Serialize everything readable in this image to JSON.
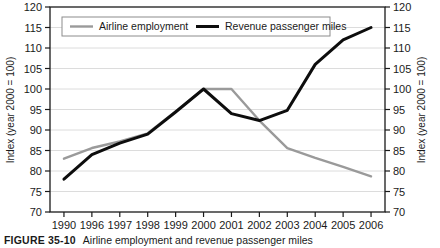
{
  "figure": {
    "caption_number": "FIGURE 35-10",
    "caption_text": "Airline employment and revenue passenger miles"
  },
  "legend": {
    "position": "top-inside",
    "items": [
      {
        "label": "Airline employment",
        "color": "#9a9a9a"
      },
      {
        "label": "Revenue passenger miles",
        "color": "#0d0d0d"
      }
    ]
  },
  "axes": {
    "left_label": "Index (year 2000 = 100)",
    "right_label": "Index (year 2000 = 100)",
    "y_ticks": [
      "70",
      "75",
      "80",
      "85",
      "90",
      "95",
      "100",
      "105",
      "110",
      "115",
      "120"
    ],
    "x_ticks": [
      "1990",
      "1996",
      "1997",
      "1998",
      "1999",
      "2000",
      "2001",
      "2002",
      "2003",
      "2004",
      "2005",
      "2006"
    ]
  },
  "colors": {
    "airline_employment": "#9a9a9a",
    "revenue_passenger_miles": "#0d0d0d",
    "grid": "#d8d8d8",
    "frame": "#1a1a1a",
    "background": "#ffffff"
  },
  "chart_data": {
    "type": "line",
    "title": "Airline employment and revenue passenger miles",
    "xlabel": "",
    "ylabel": "Index (year 2000 = 100)",
    "categories": [
      "1990",
      "1996",
      "1997",
      "1998",
      "1999",
      "2000",
      "2001",
      "2002",
      "2003",
      "2004",
      "2005",
      "2006"
    ],
    "ylim": [
      70,
      120
    ],
    "ytick_step": 5,
    "grid": true,
    "legend": "top-inside",
    "dual_axis": true,
    "series": [
      {
        "name": "Airline employment",
        "color": "#9a9a9a",
        "values": [
          83.0,
          85.6,
          87.2,
          89.2,
          94.5,
          100.0,
          100.0,
          92.3,
          85.6,
          83.2,
          81.0,
          78.7
        ]
      },
      {
        "name": "Revenue passenger miles",
        "color": "#0d0d0d",
        "values": [
          78.0,
          84.0,
          86.8,
          89.0,
          94.4,
          100.0,
          94.0,
          92.3,
          94.8,
          106.0,
          112.0,
          115.0
        ]
      }
    ]
  }
}
